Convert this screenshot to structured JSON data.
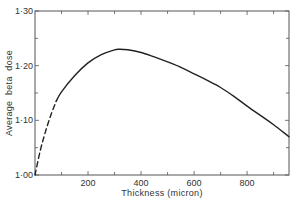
{
  "chart_data": {
    "type": "line",
    "title": "",
    "xlabel": "Thickness (micron)",
    "ylabel": "Average  beta  dose",
    "xlim": [
      0,
      958
    ],
    "ylim": [
      1.0,
      1.3
    ],
    "grid": false,
    "legend": null,
    "x_ticks": [
      200,
      400,
      600,
      800
    ],
    "x_tick_labels": [
      "200",
      "400",
      "600",
      "800"
    ],
    "x_minor_ticks": [
      100,
      300,
      500,
      700,
      900
    ],
    "y_ticks": [
      1.0,
      1.1,
      1.2,
      1.3
    ],
    "y_tick_labels": [
      "1·00",
      "1·10",
      "1·20",
      "1·30"
    ],
    "y_minor_ticks": [
      1.05,
      1.15,
      1.25
    ],
    "series": [
      {
        "name": "extrapolated (dashed)",
        "style": "dashed",
        "x": [
          0,
          20,
          40,
          60,
          80
        ],
        "y": [
          1.0,
          1.045,
          1.08,
          1.11,
          1.135
        ]
      },
      {
        "name": "measured (solid)",
        "style": "solid",
        "x": [
          80,
          100,
          150,
          200,
          250,
          300,
          320,
          350,
          400,
          450,
          500,
          550,
          600,
          650,
          700,
          750,
          800,
          850,
          900,
          958
        ],
        "y": [
          1.135,
          1.152,
          1.182,
          1.205,
          1.22,
          1.229,
          1.23,
          1.229,
          1.224,
          1.216,
          1.207,
          1.197,
          1.185,
          1.173,
          1.16,
          1.144,
          1.126,
          1.109,
          1.092,
          1.07
        ]
      }
    ]
  },
  "colors": {
    "line": "#222222",
    "axis": "#555555",
    "background": "#ffffff"
  }
}
